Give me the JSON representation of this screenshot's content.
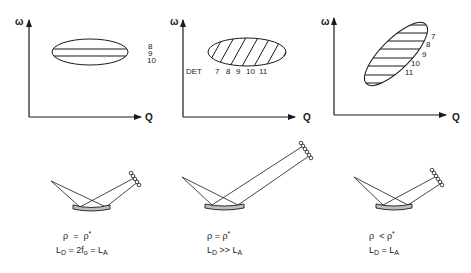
{
  "panels": [
    {
      "id": "panel-1",
      "axes": {
        "y_label": "ω",
        "x_label": "Q"
      },
      "ellipse": {
        "orientation": "horizontal",
        "fill": "horizontal-lines"
      },
      "order_labels": [
        "8",
        "9",
        "10"
      ],
      "formula": {
        "line1": {
          "lhs": "ρ",
          "op": "=",
          "rhs": "ρ",
          "rhs_sup": "*"
        },
        "line2": {
          "text_a": "L",
          "sub_a": "D",
          "mid": " = 2f",
          "sub_mid": "o",
          "eq": " = L",
          "sub_b": "A"
        }
      }
    },
    {
      "id": "panel-2",
      "axes": {
        "y_label": "ω",
        "x_label": "Q"
      },
      "ellipse": {
        "orientation": "horizontal",
        "fill": "diagonal-hatch"
      },
      "det_label": "DET",
      "order_labels": [
        "7",
        "8",
        "9",
        "10",
        "11"
      ],
      "formula": {
        "line1": {
          "lhs": "ρ",
          "op": "=",
          "rhs": "ρ",
          "rhs_sup": "*"
        },
        "line2": {
          "text_a": "L",
          "sub_a": "D",
          "op": " >> L",
          "sub_b": "A"
        }
      }
    },
    {
      "id": "panel-3",
      "axes": {
        "y_label": "ω",
        "x_label": "Q"
      },
      "ellipse": {
        "orientation": "tilted",
        "fill": "horizontal-lines"
      },
      "order_labels": [
        "7",
        "8",
        "9",
        "10",
        "11"
      ],
      "formula": {
        "line1": {
          "lhs": "ρ",
          "op": "<",
          "rhs": "ρ",
          "rhs_sup": "*"
        },
        "line2": {
          "text_a": "L",
          "sub_a": "D",
          "op": " = L",
          "sub_b": "A"
        }
      }
    }
  ],
  "colors": {
    "ink": "#1a1a1a",
    "background": "#ffffff",
    "mirror_fill": "#bdbdbd"
  }
}
